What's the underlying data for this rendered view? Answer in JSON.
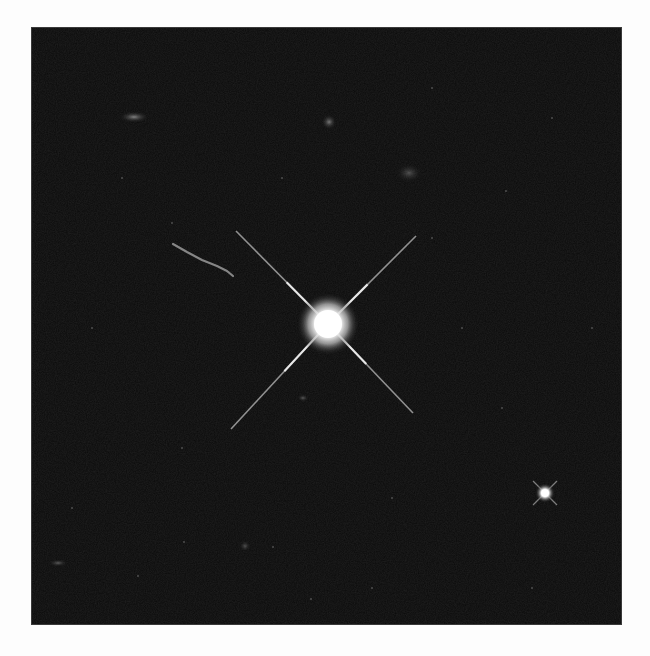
{
  "image": {
    "description": "Telescope image of a bright quasar with four diffraction spikes and a faint jet, surrounded by faint galaxies and stars",
    "background_color": "#0a0a0a",
    "page_color": "#fdfdfd",
    "frame": {
      "x": 31,
      "y": 27,
      "width": 591,
      "height": 598
    }
  },
  "objects": {
    "quasar": {
      "cx": 296,
      "cy": 296,
      "core_radius": 14,
      "glow_radius": 32,
      "spikes": [
        {
          "x2": 204,
          "y2": 203
        },
        {
          "x2": 384,
          "y2": 208
        },
        {
          "x2": 199,
          "y2": 401
        },
        {
          "x2": 381,
          "y2": 385
        }
      ]
    },
    "jet": {
      "points": [
        [
          141,
          216
        ],
        [
          155,
          224
        ],
        [
          170,
          232
        ],
        [
          185,
          238
        ],
        [
          195,
          243
        ],
        [
          201,
          248
        ]
      ]
    },
    "star": {
      "cx": 513,
      "cy": 465,
      "radius": 4,
      "spike": 12
    },
    "galaxies": [
      {
        "cx": 102,
        "cy": 89,
        "rx": 8,
        "ry": 3,
        "opacity": 0.55
      },
      {
        "cx": 297,
        "cy": 94,
        "rx": 4,
        "ry": 4,
        "opacity": 0.5
      },
      {
        "cx": 377,
        "cy": 145,
        "rx": 7,
        "ry": 5,
        "opacity": 0.3
      },
      {
        "cx": 26,
        "cy": 535,
        "rx": 5,
        "ry": 2,
        "opacity": 0.35
      },
      {
        "cx": 271,
        "cy": 370,
        "rx": 3,
        "ry": 2,
        "opacity": 0.35
      },
      {
        "cx": 213,
        "cy": 518,
        "rx": 3,
        "ry": 3,
        "opacity": 0.3
      }
    ],
    "faint_points": [
      [
        40,
        480
      ],
      [
        152,
        514
      ],
      [
        106,
        548
      ],
      [
        241,
        519
      ],
      [
        279,
        571
      ],
      [
        400,
        210
      ],
      [
        474,
        163
      ],
      [
        400,
        60
      ],
      [
        140,
        195
      ],
      [
        520,
        90
      ],
      [
        560,
        300
      ],
      [
        470,
        380
      ],
      [
        60,
        300
      ],
      [
        250,
        150
      ],
      [
        340,
        560
      ],
      [
        150,
        420
      ],
      [
        360,
        470
      ],
      [
        500,
        560
      ],
      [
        90,
        150
      ],
      [
        430,
        300
      ]
    ]
  }
}
